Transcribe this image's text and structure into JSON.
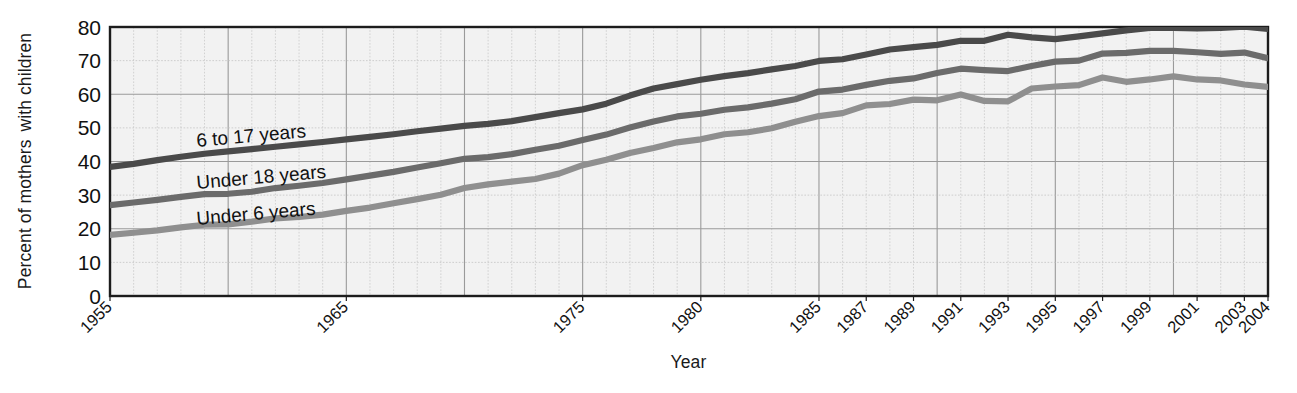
{
  "chart_data": {
    "type": "line",
    "title": "",
    "xlabel": "Year",
    "ylabel": "Percent of mothers with children",
    "ylabel_line1": "Percent of mothers",
    "ylabel_line2": "with children",
    "xlim": [
      1955,
      2004
    ],
    "ylim": [
      0,
      80
    ],
    "grid": true,
    "legend_position": "inline-on-lines",
    "ytick_labels": [
      "0",
      "10",
      "20",
      "30",
      "40",
      "50",
      "60",
      "70",
      "80"
    ],
    "ytick_values": [
      0,
      10,
      20,
      30,
      40,
      50,
      60,
      70,
      80
    ],
    "xtick_labels": [
      "1955",
      "1965",
      "1975",
      "1980",
      "1985",
      "1987",
      "1989",
      "1991",
      "1993",
      "1995",
      "1997",
      "1999",
      "2001",
      "2003",
      "2004"
    ],
    "xtick_values": [
      1955,
      1965,
      1975,
      1980,
      1985,
      1987,
      1989,
      1991,
      1993,
      1995,
      1997,
      1999,
      2001,
      2003,
      2004
    ],
    "x": [
      1955,
      1956,
      1957,
      1958,
      1959,
      1960,
      1961,
      1962,
      1963,
      1964,
      1965,
      1966,
      1967,
      1968,
      1969,
      1970,
      1971,
      1972,
      1973,
      1974,
      1975,
      1976,
      1977,
      1978,
      1979,
      1980,
      1981,
      1982,
      1983,
      1984,
      1985,
      1986,
      1987,
      1988,
      1989,
      1990,
      1991,
      1992,
      1993,
      1994,
      1995,
      1996,
      1997,
      1998,
      1999,
      2000,
      2001,
      2002,
      2003,
      2004
    ],
    "series": [
      {
        "name": "6 to 17 years",
        "label": "6 to 17 years",
        "color": "#4a4a4a",
        "values": [
          38.4,
          39.3,
          40.4,
          41.4,
          42.3,
          43.0,
          43.7,
          44.4,
          45.1,
          45.8,
          46.6,
          47.3,
          48.1,
          49.0,
          49.8,
          50.6,
          51.2,
          52.0,
          53.2,
          54.4,
          55.5,
          57.2,
          59.6,
          61.7,
          63.0,
          64.3,
          65.4,
          66.3,
          67.4,
          68.4,
          69.9,
          70.4,
          71.8,
          73.3,
          74.0,
          74.7,
          75.9,
          75.9,
          77.7,
          76.9,
          76.4,
          77.2,
          78.1,
          79.0,
          79.7,
          79.7,
          79.6,
          79.7,
          80.1,
          79.4
        ]
      },
      {
        "name": "Under 18 years",
        "label": "Under 18 years",
        "color": "#6b6b6b",
        "values": [
          27.0,
          27.8,
          28.6,
          29.5,
          30.3,
          30.4,
          31.0,
          32.1,
          32.8,
          33.6,
          34.7,
          35.8,
          36.9,
          38.2,
          39.5,
          40.8,
          41.3,
          42.2,
          43.5,
          44.7,
          46.4,
          48.0,
          50.1,
          51.9,
          53.4,
          54.2,
          55.4,
          56.1,
          57.2,
          58.5,
          60.8,
          61.4,
          62.8,
          64.0,
          64.7,
          66.3,
          67.6,
          67.2,
          66.9,
          68.4,
          69.7,
          70.0,
          72.1,
          72.3,
          72.9,
          72.9,
          72.5,
          72.0,
          72.4,
          70.7
        ]
      },
      {
        "name": "Under 6 years",
        "label": "Under 6 years",
        "color": "#8f8f8f",
        "values": [
          18.2,
          18.8,
          19.5,
          20.4,
          21.2,
          21.3,
          22.1,
          23.1,
          23.5,
          24.2,
          25.3,
          26.3,
          27.6,
          28.8,
          30.1,
          32.1,
          33.2,
          34.0,
          34.8,
          36.4,
          38.9,
          40.5,
          42.5,
          44.0,
          45.7,
          46.6,
          48.1,
          48.7,
          49.9,
          51.8,
          53.5,
          54.4,
          56.7,
          57.1,
          58.4,
          58.2,
          59.9,
          58.0,
          57.9,
          61.7,
          62.3,
          62.7,
          65.0,
          63.7,
          64.4,
          65.3,
          64.4,
          64.1,
          62.9,
          62.2
        ]
      }
    ]
  },
  "axes": {
    "x_title": "Year",
    "y_title_line1": "Percent of mothers",
    "y_title_line2": "with children"
  }
}
